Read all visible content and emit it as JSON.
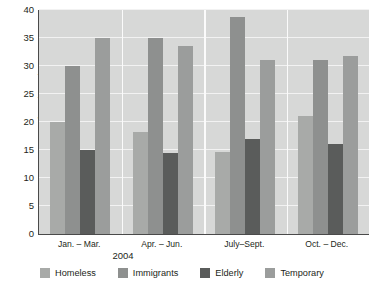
{
  "chart_data": {
    "type": "bar",
    "title": "",
    "xlabel": "2004",
    "ylabel": "Percentage of Total Number",
    "categories": [
      "Jan. – Mar.",
      "Apr. – Jun.",
      "July–Sept.",
      "Oct. – Dec."
    ],
    "series": [
      {
        "name": "Homeless",
        "color": "#a8aaa8",
        "values": [
          20.0,
          18.3,
          14.7,
          21.0
        ]
      },
      {
        "name": "Immigrants",
        "color": "#8e908f",
        "values": [
          30.0,
          35.0,
          38.7,
          31.0
        ]
      },
      {
        "name": "Elderly",
        "color": "#5a5c5b",
        "values": [
          15.0,
          14.5,
          17.0,
          16.0
        ]
      },
      {
        "name": "Temporary",
        "color": "#9b9d9c",
        "values": [
          35.0,
          33.5,
          31.0,
          31.7
        ]
      }
    ],
    "ylim": [
      0,
      40
    ],
    "yticks": [
      0,
      5,
      10,
      15,
      20,
      25,
      30,
      35,
      40
    ],
    "ytick_labels": [
      "0",
      "5",
      "10",
      "15",
      "20",
      "25",
      "30",
      "35",
      "40"
    ],
    "grid": true,
    "legend_position": "bottom",
    "plot_background": "#d7d8d7",
    "gridline_color": "#f2f2f2",
    "axis_color": "#4a4a4a",
    "text_color": "#231f20"
  }
}
